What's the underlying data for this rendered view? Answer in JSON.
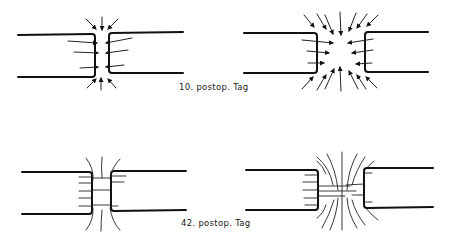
{
  "figure": {
    "panels": [
      {
        "id": "top-left",
        "stage": "10. postop. Tag",
        "description": "narrow gap, arrows converging on gap"
      },
      {
        "id": "top-right",
        "stage": "10. postop. Tag",
        "description": "wide gap, many arrows converging on center"
      },
      {
        "id": "bottom-left",
        "stage": "42. postop. Tag",
        "description": "narrow gap bridged by fibers"
      },
      {
        "id": "bottom-right",
        "stage": "42. postop. Tag",
        "description": "wide gap bridged by radiating fibers"
      }
    ],
    "labels": {
      "day10": "10. postop. Tag",
      "day42": "42. postop. Tag"
    },
    "colors": {
      "line": "#111111",
      "background": "#ffffff"
    }
  }
}
